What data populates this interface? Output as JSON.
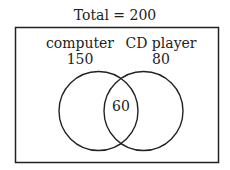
{
  "title": "Total = 200",
  "sets": [
    {
      "name": "computer",
      "count": "150"
    },
    {
      "name": "CD player",
      "count": "80"
    }
  ],
  "intersection": {
    "count": "60"
  },
  "colors": {
    "stroke": "#222222",
    "background": "#ffffff"
  }
}
